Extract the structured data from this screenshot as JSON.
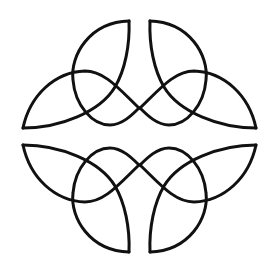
{
  "figure": {
    "background_color": "#ffffff",
    "stroke_color": "#111111",
    "stroke_width": 3,
    "symmetry": {
      "vertical_axis_x": 139.5,
      "horizontal_axis_y": 136.5
    },
    "quadrants": [
      {
        "name": "top-left",
        "transform": ""
      },
      {
        "name": "top-right",
        "transform": "translate(279,0) scale(-1,1)"
      },
      {
        "name": "bottom-left",
        "transform": "translate(0,273) scale(1,-1)"
      },
      {
        "name": "bottom-right",
        "transform": "translate(279,273) scale(-1,-1)"
      }
    ],
    "base_paths": [
      {
        "name": "lower-edge-left-leaf-and-outer-edge-vertical-leaf",
        "d": "M23,128 C60,128 100,112 115,87 C125,70 130,45 129,21"
      },
      {
        "name": "inner-arc-vertical-leaf",
        "d": "M129,21 C90,22 70,55 73,80 C75,105 92,125 110,125 C122,125 132,115 139,108"
      },
      {
        "name": "upper-arc-left-leaf",
        "d": "M23,128 C30,95 55,72 85,71 C105,71 120,90 139,108"
      }
    ]
  }
}
